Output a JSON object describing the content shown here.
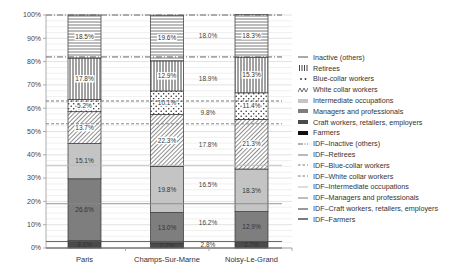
{
  "chart_data": {
    "type": "bar",
    "stacked": true,
    "title": "",
    "xlabel": "",
    "ylabel": "",
    "ylim": [
      0,
      100
    ],
    "yticks": [
      "0%",
      "10%",
      "20%",
      "30%",
      "40%",
      "50%",
      "60%",
      "70%",
      "80%",
      "90%",
      "100%"
    ],
    "categories": [
      "Paris",
      "Champs-Sur-Marne",
      "Noisy-Le-Grand"
    ],
    "series": [
      {
        "name": "Farmers",
        "values": [
          0.0,
          0.0,
          0.0
        ],
        "labels": [
          "",
          "",
          ""
        ],
        "color": "#111111",
        "pattern": "solid"
      },
      {
        "name": "Craft workers, retailers, employers",
        "values": [
          3.1,
          2.2,
          2.7
        ],
        "labels": [
          "3.1%",
          "2.2%",
          "2.7%"
        ],
        "color": "#4a4a4a",
        "pattern": "solid"
      },
      {
        "name": "Managers and professionals",
        "values": [
          26.6,
          13.0,
          12.9
        ],
        "labels": [
          "26.6%",
          "13.0%",
          "12.9%"
        ],
        "color": "#7e7e7e",
        "pattern": "solid"
      },
      {
        "name": "Intermediate occupations",
        "values": [
          15.1,
          19.8,
          18.3
        ],
        "labels": [
          "15.1%",
          "19.8%",
          "18.3%"
        ],
        "color": "#c4c4c4",
        "pattern": "solid"
      },
      {
        "name": "White collar workers",
        "values": [
          13.7,
          22.3,
          21.3
        ],
        "labels": [
          "13.7%",
          "22.3%",
          "21.3%"
        ],
        "color": "#ffffff",
        "pattern": "diagonal"
      },
      {
        "name": "Blue-collar workers",
        "values": [
          5.2,
          10.1,
          11.4
        ],
        "labels": [
          "5.2%",
          "10.1%",
          "11.4%"
        ],
        "color": "#ffffff",
        "pattern": "dots"
      },
      {
        "name": "Retirees",
        "values": [
          17.8,
          12.9,
          15.3
        ],
        "labels": [
          "17.8%",
          "12.9%",
          "15.3%"
        ],
        "color": "#ffffff",
        "pattern": "vertical"
      },
      {
        "name": "Inactive (others)",
        "values": [
          18.5,
          19.6,
          18.3
        ],
        "labels": [
          "18.5%",
          "19.6%",
          "18.3%"
        ],
        "color": "#ffffff",
        "pattern": "horizontal"
      }
    ],
    "reference_lines": [
      {
        "name": "IDF–Inactive (others)",
        "value": 18.0,
        "label": "18.0%",
        "style": "dash-dot",
        "color": "#555555"
      },
      {
        "name": "IDF–Retirees",
        "value": 18.9,
        "label": "18.9%",
        "style": "dash-dot",
        "color": "#555555"
      },
      {
        "name": "IDF–Blue-collar workers",
        "value": 9.8,
        "label": "9.8%",
        "style": "dashed",
        "color": "#666666"
      },
      {
        "name": "IDF–White collar workers",
        "value": 17.8,
        "label": "17.8%",
        "style": "dashed",
        "color": "#777777"
      },
      {
        "name": "IDF–Intermediate occupations",
        "value": 16.5,
        "label": "16.5%",
        "style": "solid",
        "color": "#bbbbbb"
      },
      {
        "name": "IDF–Managers and professionals",
        "value": 16.2,
        "label": "16.2%",
        "style": "solid",
        "color": "#888888"
      },
      {
        "name": "IDF–Craft workers, retailers, employers",
        "value": 2.8,
        "label": "2.8%",
        "style": "solid",
        "color": "#555555"
      },
      {
        "name": "IDF–Farmers",
        "value": 0.0,
        "label": "",
        "style": "solid",
        "color": "#222222"
      }
    ],
    "grid": true,
    "legend_position": "right"
  },
  "legend": [
    {
      "label": "Inactive (others)",
      "swatch": "hline"
    },
    {
      "label": "Retirees",
      "swatch": "vertical"
    },
    {
      "label": "Blue-collar workers",
      "swatch": "dots"
    },
    {
      "label": "White collar workers",
      "swatch": "diagonal"
    },
    {
      "label": "Intermediate occupations",
      "swatch": "light"
    },
    {
      "label": "Managers and professionals",
      "swatch": "mid"
    },
    {
      "label": "Craft workers, retailers, employers",
      "swatch": "dark"
    },
    {
      "label": "Farmers",
      "swatch": "black"
    },
    {
      "label": "IDF–Inactive (others)",
      "swatch": "line-dashdot"
    },
    {
      "label": "IDF–Retirees",
      "swatch": "line-solid-dark"
    },
    {
      "label": "IDF–Blue-collar workers",
      "swatch": "line-dashed"
    },
    {
      "label": "IDF–White collar workers",
      "swatch": "line-dashed"
    },
    {
      "label": "IDF–Intermediate occupations",
      "swatch": "line-light"
    },
    {
      "label": "IDF–Managers and professionals",
      "swatch": "line-mid"
    },
    {
      "label": "IDF–Craft workers, retailers, employers",
      "swatch": "line-dark"
    },
    {
      "label": "IDF–Farmers",
      "swatch": "line-black"
    }
  ]
}
